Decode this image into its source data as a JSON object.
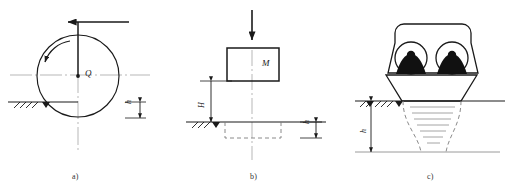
{
  "figure": {
    "panels": [
      {
        "id": "a",
        "caption": "a)",
        "labels": {
          "load": "Q",
          "depth": "h"
        },
        "elements": [
          "horizontal-force-arrow",
          "vertical-load-line",
          "rolling-wheel-circle",
          "rotation-arrow",
          "ground-line",
          "ground-hatching",
          "depth-dimension"
        ]
      },
      {
        "id": "b",
        "caption": "b)",
        "labels": {
          "mass": "M",
          "drop_height": "H",
          "depth": "h"
        },
        "elements": [
          "downward-force-arrow",
          "mass-block",
          "height-dimension",
          "ground-line",
          "ground-hatching",
          "dashed-imprint-rectangle",
          "depth-dimension"
        ]
      },
      {
        "id": "c",
        "caption": "c)",
        "labels": {
          "depth": "h"
        },
        "elements": [
          "compactor-body",
          "wheel-left",
          "wheel-right",
          "base-plate-trapezoid",
          "ground-line",
          "ground-hatching",
          "stress-bulb-dashed",
          "stress-lines",
          "depth-dimension",
          "lower-boundary-line"
        ]
      }
    ],
    "colors": {
      "line": "#1a1a1a",
      "axis": "#9a9a9a",
      "dashed": "#7d7d7d",
      "fill_dark": "#111111",
      "background": "#ffffff"
    }
  }
}
